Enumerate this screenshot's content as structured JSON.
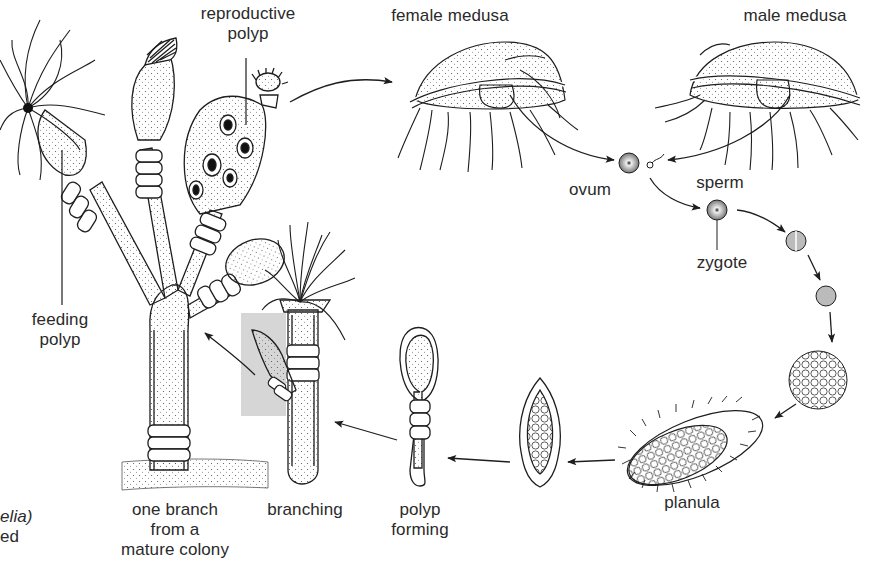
{
  "diagram": {
    "labels": {
      "reproductive_polyp": [
        "reproductive",
        "polyp"
      ],
      "female_medusa": "female medusa",
      "male_medusa": "male medusa",
      "ovum": "ovum",
      "sperm": "sperm",
      "zygote": "zygote",
      "feeding_polyp": [
        "feeding",
        "polyp"
      ],
      "planula": "planula",
      "polyp_forming": [
        "polyp",
        "forming"
      ],
      "branching": "branching",
      "one_branch": [
        "one branch",
        "from a",
        "mature colony"
      ],
      "caption_fragment": [
        "elia)",
        "ed"
      ]
    },
    "stages": [
      "reproductive polyp",
      "female medusa",
      "male medusa",
      "ovum + sperm",
      "zygote",
      "cleavage (2-cell)",
      "cleavage (4-cell)",
      "blastula",
      "planula",
      "settling larva",
      "polyp forming",
      "branching",
      "one branch from a mature colony"
    ],
    "colors": {
      "ink": "#1e1e1e",
      "highlight_box": "#d6d6d6",
      "background": "#ffffff"
    }
  }
}
